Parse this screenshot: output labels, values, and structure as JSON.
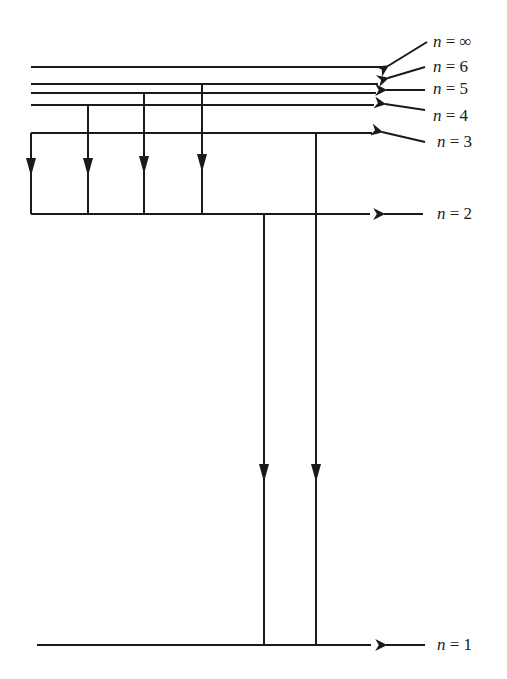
{
  "diagram": {
    "levels": [
      {
        "name": "n-infinity",
        "label_n": "n",
        "label_eq": " = ",
        "label_val": "∞",
        "y": 67,
        "x1": 31,
        "x2": 380
      },
      {
        "name": "n-6",
        "label_n": "n",
        "label_eq": " = ",
        "label_val": "6",
        "y": 84,
        "x1": 31,
        "x2": 378
      },
      {
        "name": "n-5",
        "label_n": "n",
        "label_eq": " = ",
        "label_val": "5",
        "y": 93,
        "x1": 31,
        "x2": 376
      },
      {
        "name": "n-4",
        "label_n": "n",
        "label_eq": " = ",
        "label_val": "4",
        "y": 105,
        "x1": 31,
        "x2": 374
      },
      {
        "name": "n-3",
        "label_n": "n",
        "label_eq": " = ",
        "label_val": "3",
        "y": 133,
        "x1": 31,
        "x2": 372
      },
      {
        "name": "n-2",
        "label_n": "n",
        "label_eq": " = ",
        "label_val": "2",
        "y": 214,
        "x1": 31,
        "x2": 370
      },
      {
        "name": "n-1",
        "label_n": "n",
        "label_eq": " = ",
        "label_val": "1",
        "y": 645,
        "x1": 37,
        "x2": 371
      }
    ],
    "transitions": [
      {
        "from": 3,
        "to": 2,
        "x": 31,
        "y1": 133,
        "y2": 214,
        "arrow_y": 172
      },
      {
        "from": 4,
        "to": 2,
        "x": 88,
        "y1": 105,
        "y2": 214,
        "arrow_y": 172
      },
      {
        "from": 5,
        "to": 2,
        "x": 144,
        "y1": 93,
        "y2": 214,
        "arrow_y": 170
      },
      {
        "from": 6,
        "to": 2,
        "x": 202,
        "y1": 84,
        "y2": 214,
        "arrow_y": 168
      },
      {
        "from": 2,
        "to": 1,
        "x": 264,
        "y1": 214,
        "y2": 645,
        "arrow_y": 478
      },
      {
        "from": 3,
        "to": 1,
        "x": 316,
        "y1": 133,
        "y2": 645,
        "arrow_y": 478
      }
    ],
    "pointer_arrows": [
      {
        "x1": 427,
        "y1": 42,
        "x2": 388,
        "y2": 66
      },
      {
        "x1": 425,
        "y1": 67,
        "x2": 388,
        "y2": 78
      },
      {
        "x1": 425,
        "y1": 90,
        "x2": 386,
        "y2": 90
      },
      {
        "x1": 425,
        "y1": 110,
        "x2": 385,
        "y2": 104
      },
      {
        "x1": 425,
        "y1": 142,
        "x2": 382,
        "y2": 132
      },
      {
        "x1": 423,
        "y1": 214,
        "x2": 384,
        "y2": 214
      },
      {
        "x1": 425,
        "y1": 645,
        "x2": 386,
        "y2": 645
      }
    ],
    "label_positions": [
      {
        "x": 433,
        "y": 47
      },
      {
        "x": 433,
        "y": 72
      },
      {
        "x": 433,
        "y": 94
      },
      {
        "x": 433,
        "y": 121
      },
      {
        "x": 437,
        "y": 147
      },
      {
        "x": 437,
        "y": 219
      },
      {
        "x": 437,
        "y": 650
      }
    ]
  }
}
